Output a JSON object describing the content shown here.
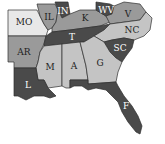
{
  "map": {
    "region": "Southeastern United States",
    "colors": {
      "dark": "#4a4a4a",
      "mid": "#9a9a9a",
      "light": "#c4c4c4",
      "lightest": "#e8e8e8",
      "stroke": "#2e2e2e"
    },
    "states": [
      {
        "abbr": "MO",
        "name": "Missouri",
        "shade": "lightest"
      },
      {
        "abbr": "IL",
        "name": "Illinois",
        "shade": "mid"
      },
      {
        "abbr": "IN",
        "name": "Indiana",
        "shade": "dark"
      },
      {
        "abbr": "K",
        "name": "Kentucky",
        "shade": "mid"
      },
      {
        "abbr": "WV",
        "name": "West Virginia",
        "shade": "dark"
      },
      {
        "abbr": "V",
        "name": "Virginia",
        "shade": "mid"
      },
      {
        "abbr": "AR",
        "name": "Arkansas",
        "shade": "mid"
      },
      {
        "abbr": "T",
        "name": "Tennessee",
        "shade": "dark"
      },
      {
        "abbr": "NC",
        "name": "North Carolina",
        "shade": "light"
      },
      {
        "abbr": "SC",
        "name": "South Carolina",
        "shade": "dark"
      },
      {
        "abbr": "M",
        "name": "Mississippi",
        "shade": "light"
      },
      {
        "abbr": "A",
        "name": "Alabama",
        "shade": "light"
      },
      {
        "abbr": "G",
        "name": "Georgia",
        "shade": "light"
      },
      {
        "abbr": "L",
        "name": "Louisiana",
        "shade": "dark"
      },
      {
        "abbr": "F",
        "name": "Florida",
        "shade": "dark"
      }
    ]
  }
}
